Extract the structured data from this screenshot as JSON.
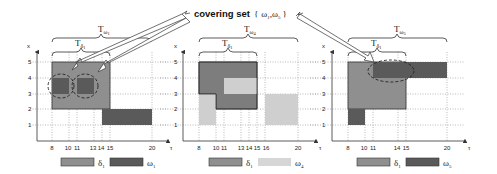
{
  "title": {
    "label": "covering set",
    "set": "{ ω1,ω5 }",
    "set_parts": [
      "{",
      "ω",
      "1",
      ",",
      "ω",
      "5",
      "}"
    ]
  },
  "colors": {
    "delta": "#8f8f8f",
    "omega_dark": "#5a5a5a",
    "omega_light": "#cfcfcf",
    "axis": "#333333",
    "grid": "#777777"
  },
  "axes": {
    "x_label": "x",
    "tau_label": "τ",
    "y_ticks": [
      "1",
      "2",
      "3",
      "4",
      "5"
    ]
  },
  "panels": [
    {
      "id": "panel-1",
      "brace_outer": {
        "label": "T",
        "sub": "ω1",
        "sub_main": "ω",
        "sub_idx": "1"
      },
      "brace_inner": {
        "label": "T",
        "sub": "δ1",
        "sub_main": "δ",
        "sub_idx": "1"
      },
      "tau_ticks": [
        "8",
        "10",
        "11",
        "13",
        "14",
        "15",
        "20"
      ],
      "legend": [
        {
          "label_main": "δ",
          "label_idx": "1",
          "color": "#8f8f8f"
        },
        {
          "label_main": "ω",
          "label_idx": "1",
          "color": "#5a5a5a"
        }
      ]
    },
    {
      "id": "panel-2",
      "brace_outer": {
        "label": "T",
        "sub": "ω4",
        "sub_main": "ω",
        "sub_idx": "4"
      },
      "brace_inner": {
        "label": "T",
        "sub": "δ1",
        "sub_main": "δ",
        "sub_idx": "1"
      },
      "tau_ticks": [
        "8",
        "10",
        "11",
        "13",
        "14",
        "15",
        "16",
        "20"
      ],
      "legend": [
        {
          "label_main": "δ",
          "label_idx": "1",
          "color": "#8f8f8f"
        },
        {
          "label_main": "ω",
          "label_idx": "4",
          "color": "#cfcfcf"
        }
      ]
    },
    {
      "id": "panel-3",
      "brace_outer": {
        "label": "T",
        "sub": "ω5",
        "sub_main": "ω",
        "sub_idx": "5"
      },
      "brace_inner": {
        "label": "T",
        "sub": "δ1",
        "sub_main": "δ",
        "sub_idx": "1"
      },
      "tau_ticks": [
        "8",
        "10",
        "11",
        "14",
        "15",
        "20"
      ],
      "legend": [
        {
          "label_main": "δ",
          "label_idx": "1",
          "color": "#8f8f8f"
        },
        {
          "label_main": "ω",
          "label_idx": "5",
          "color": "#5a5a5a"
        }
      ]
    }
  ]
}
